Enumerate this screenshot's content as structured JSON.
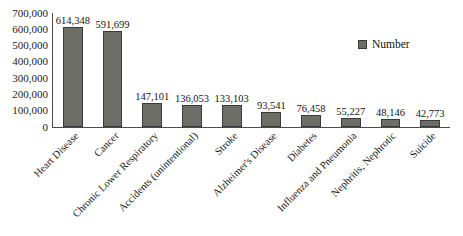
{
  "chart_data": {
    "type": "bar",
    "title": "",
    "xlabel": "",
    "ylabel": "",
    "ylim": [
      0,
      700000
    ],
    "ytick_step": 100000,
    "grid": false,
    "legend_position": "top-right",
    "categories": [
      "Heart Disease",
      "Cancer",
      "Chronic Lower Respiratory",
      "Accidents (unintentional)",
      "Stroke",
      "Alzheimer's Disease",
      "Diabetes",
      "Influenza and Pneumonia",
      "Nephritis, Nephrotic",
      "Suicide"
    ],
    "series": [
      {
        "name": "Number",
        "values": [
          614348,
          591699,
          147101,
          136053,
          133103,
          93541,
          76458,
          55227,
          48146,
          42773
        ]
      }
    ],
    "value_labels": [
      "614,348",
      "591,699",
      "147,101",
      "136,053",
      "133,103",
      "93,541",
      "76,458",
      "55,227",
      "48,146",
      "42,773"
    ],
    "ytick_labels": [
      "700,000",
      "600,000",
      "500,000",
      "400,000",
      "300,000",
      "200,000",
      "100,000",
      "0"
    ],
    "colors": {
      "bar_fill": "#6e6e68",
      "bar_outline": "#3a3a38",
      "axis": "#4a4a4a",
      "text": "#1a1a1a",
      "background": "#ffffff"
    }
  },
  "legend": {
    "entries": [
      {
        "label": "Number",
        "color": "#6e6e68"
      }
    ]
  }
}
